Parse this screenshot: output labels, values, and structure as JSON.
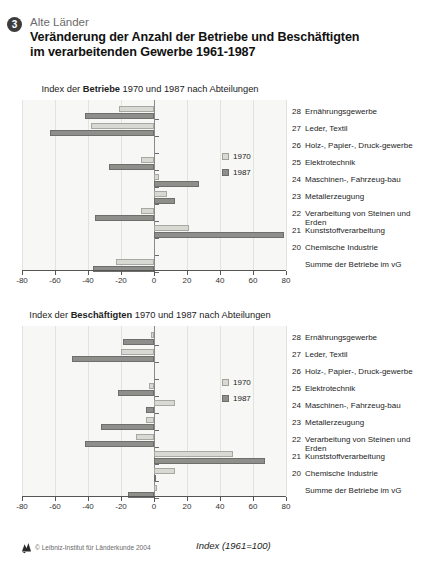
{
  "header": {
    "badge": "3",
    "kicker": "Alte Länder",
    "title_line1": "Veränderung der Anzahl der Betriebe und Beschäftigten",
    "title_line2": "im verarbeitenden Gewerbe 1961-1987"
  },
  "legend": {
    "series1": "1970",
    "series2": "1987"
  },
  "footer": {
    "copyright": "© Leibniz-Institut für Länderkunde 2004",
    "axis_caption": "Index (1961=100)"
  },
  "colors": {
    "series_1970": "#d9d9d4",
    "series_1987": "#8e8e8a",
    "plot_bg": "#f7f7f5",
    "grid": "#e2e2de",
    "axis": "#555555",
    "badge": "#3c3c3c"
  },
  "categories": [
    {
      "num": "28",
      "label": "Ernährungsgewerbe"
    },
    {
      "num": "27",
      "label": "Leder, Textil"
    },
    {
      "num": "26",
      "label": "Holz-, Papier-, Druck-gewerbe"
    },
    {
      "num": "25",
      "label": "Elektrotechnik"
    },
    {
      "num": "24",
      "label": "Maschinen-, Fahrzeug-bau"
    },
    {
      "num": "23",
      "label": "Metallerzeugung"
    },
    {
      "num": "22",
      "label": "Verarbeitung von Steinen und Erden"
    },
    {
      "num": "21",
      "label": "Kunststoffverarbeitung"
    },
    {
      "num": "20",
      "label": "Chemische Industrie"
    },
    {
      "num": "",
      "label": "Summe der Betriebe im vG"
    }
  ],
  "chart_data": [
    {
      "type": "bar",
      "orientation": "horizontal",
      "title": "Index der Betriebe 1970 und 1987 nach Abteilungen",
      "title_prefix": "Index der ",
      "title_bold": "Betriebe",
      "title_suffix": " 1970 und 1987 nach Abteilungen",
      "xlabel": "Index (1961=100)",
      "ylabel": "",
      "xlim": [
        -80,
        80
      ],
      "xticks": [
        -80,
        -60,
        -40,
        -20,
        0,
        20,
        40,
        60,
        80
      ],
      "grid": true,
      "legend_position": "right",
      "categories": [
        "28 Ernährungsgewerbe",
        "27 Leder, Textil",
        "26 Holz-, Papier-, Druckgewerbe",
        "25 Elektrotechnik",
        "24 Maschinen-, Fahrzeugbau",
        "23 Metallerzeugung",
        "22 Verarbeitung von Steinen und Erden",
        "21 Kunststoffverarbeitung",
        "20 Chemische Industrie",
        "Summe der Betriebe im vG"
      ],
      "series": [
        {
          "name": "1970",
          "values": [
            -21,
            -38,
            null,
            -8,
            3,
            8,
            -8,
            21,
            null,
            -23
          ]
        },
        {
          "name": "1987",
          "values": [
            -42,
            -63,
            null,
            -27,
            27,
            13,
            -36,
            79,
            null,
            -37
          ]
        }
      ]
    },
    {
      "type": "bar",
      "orientation": "horizontal",
      "title": "Index der Beschäftigten 1970 und 1987 nach Abteilungen",
      "title_prefix": "Index der ",
      "title_bold": "Beschäftigten",
      "title_suffix": " 1970 und 1987 nach Abteilungen",
      "xlabel": "Index (1961=100)",
      "ylabel": "",
      "xlim": [
        -80,
        80
      ],
      "xticks": [
        -80,
        -60,
        -40,
        -20,
        0,
        20,
        40,
        60,
        80
      ],
      "grid": true,
      "legend_position": "right",
      "categories": [
        "28 Ernährungsgewerbe",
        "27 Leder, Textil",
        "26 Holz-, Papier-, Druckgewerbe",
        "25 Elektrotechnik",
        "24 Maschinen-, Fahrzeugbau",
        "23 Metallerzeugung",
        "22 Verarbeitung von Steinen und Erden",
        "21 Kunststoffverarbeitung",
        "20 Chemische Industrie",
        "Summe der Betriebe im vG"
      ],
      "series": [
        {
          "name": "1970",
          "values": [
            -2,
            -20,
            null,
            -3,
            13,
            -5,
            -11,
            48,
            13,
            2
          ]
        },
        {
          "name": "1987",
          "values": [
            -19,
            -50,
            null,
            -22,
            -5,
            -32,
            -42,
            67,
            1,
            -16
          ]
        }
      ]
    }
  ]
}
